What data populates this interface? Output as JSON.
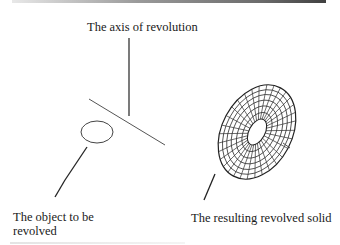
{
  "diagram": {
    "labels": {
      "axis": "The axis of revolution",
      "object": "The object to be revolved",
      "solid": "The resulting revolved solid"
    },
    "elements": {
      "axis_line": "axis-of-revolution-line",
      "profile": "ellipse-profile",
      "solid": "wireframe-torus"
    }
  },
  "colors": {
    "line": "#333333",
    "text": "#1a1a1a",
    "background": "#ffffff"
  }
}
